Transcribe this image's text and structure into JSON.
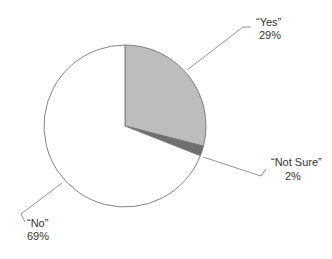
{
  "chart_data": {
    "type": "pie",
    "title": "",
    "slices": [
      {
        "label": "“Yes”",
        "value": 29,
        "value_label": "29%",
        "color": "#bdbdbd"
      },
      {
        "label": "“Not Sure”",
        "value": 2,
        "value_label": "2%",
        "color": "#6e6e6e"
      },
      {
        "label": "“No”",
        "value": 69,
        "value_label": "69%",
        "color": "#ffffff"
      }
    ],
    "start_angle_deg": 0,
    "direction": "clockwise",
    "outline_color": "#777777"
  }
}
